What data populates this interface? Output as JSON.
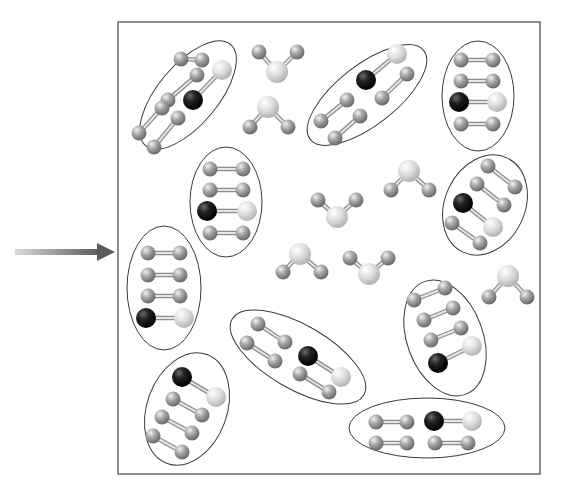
{
  "diagram": {
    "title": "",
    "colors": {
      "background": "#ffffff",
      "frame": "#6a6a6a",
      "ellipse": "#3a3a3a",
      "atom_gray": "#8a8a8a",
      "atom_light": "#d2d2d2",
      "atom_dark": "#111111",
      "bond": "#b8b8b8",
      "arrow_start": "#d8d8d8",
      "arrow_end": "#5a5a5a"
    },
    "frame": {
      "x": 118,
      "y": 22,
      "w": 422,
      "h": 452
    },
    "arrow": {
      "x1": 15,
      "y1": 252,
      "x2": 115,
      "y2": 252
    },
    "clusters": [
      {
        "name": "cluster-top-left",
        "cx": 188,
        "cy": 95,
        "rx": 30,
        "ry": 66,
        "rot": 40,
        "molecules": [
          {
            "a": [
              168,
              100,
              "g"
            ],
            "b": [
              197,
              75,
              "g"
            ]
          },
          {
            "a": [
              193,
              100,
              "d"
            ],
            "b": [
              222,
              70,
              "l"
            ]
          },
          {
            "a": [
              139,
              133,
              "g"
            ],
            "b": [
              162,
              108,
              "g"
            ]
          },
          {
            "a": [
              154,
              147,
              "g"
            ],
            "b": [
              178,
              118,
              "g"
            ]
          },
          {
            "a": [
              181,
              59,
              "g"
            ],
            "b": [
              202,
              60,
              "g"
            ]
          }
        ]
      },
      {
        "name": "cluster-top-center",
        "cx": 367,
        "cy": 95,
        "rx": 30,
        "ry": 72,
        "rot": 52,
        "molecules": [
          {
            "a": [
              366,
              80,
              "d"
            ],
            "b": [
              397,
              54,
              "l"
            ]
          },
          {
            "a": [
              382,
              98,
              "g"
            ],
            "b": [
              407,
              74,
              "g"
            ]
          },
          {
            "a": [
              321,
              121,
              "g"
            ],
            "b": [
              347,
              100,
              "g"
            ]
          },
          {
            "a": [
              335,
              138,
              "g"
            ],
            "b": [
              360,
              116,
              "g"
            ]
          }
        ]
      },
      {
        "name": "cluster-top-right",
        "cx": 478,
        "cy": 96,
        "rx": 36,
        "ry": 55,
        "rot": 0,
        "molecules": [
          {
            "a": [
              461,
              60,
              "g"
            ],
            "b": [
              493,
              60,
              "g"
            ]
          },
          {
            "a": [
              461,
              81,
              "g"
            ],
            "b": [
              493,
              81,
              "g"
            ]
          },
          {
            "a": [
              459,
              102,
              "d"
            ],
            "b": [
              497,
              102,
              "l"
            ]
          },
          {
            "a": [
              461,
              124,
              "g"
            ],
            "b": [
              493,
              124,
              "g"
            ]
          }
        ]
      },
      {
        "name": "cluster-mid-left",
        "cx": 226,
        "cy": 202,
        "rx": 36,
        "ry": 55,
        "rot": 0,
        "molecules": [
          {
            "a": [
              210,
              169,
              "g"
            ],
            "b": [
              243,
              169,
              "g"
            ]
          },
          {
            "a": [
              210,
              190,
              "g"
            ],
            "b": [
              243,
              190,
              "g"
            ]
          },
          {
            "a": [
              207,
              211,
              "d"
            ],
            "b": [
              247,
              211,
              "l"
            ]
          },
          {
            "a": [
              210,
              233,
              "g"
            ],
            "b": [
              243,
              233,
              "g"
            ]
          }
        ]
      },
      {
        "name": "cluster-right-mid",
        "cx": 485,
        "cy": 205,
        "rx": 40,
        "ry": 52,
        "rot": 25,
        "molecules": [
          {
            "a": [
              488,
              166,
              "g"
            ],
            "b": [
              515,
              187,
              "g"
            ]
          },
          {
            "a": [
              477,
              184,
              "g"
            ],
            "b": [
              504,
              205,
              "g"
            ]
          },
          {
            "a": [
              463,
              203,
              "d"
            ],
            "b": [
              493,
              227,
              "l"
            ]
          },
          {
            "a": [
              452,
              223,
              "g"
            ],
            "b": [
              480,
              243,
              "g"
            ]
          }
        ]
      },
      {
        "name": "cluster-left-vertical",
        "cx": 164,
        "cy": 288,
        "rx": 37,
        "ry": 62,
        "rot": 0,
        "molecules": [
          {
            "a": [
              148,
              253,
              "g"
            ],
            "b": [
              180,
              253,
              "g"
            ]
          },
          {
            "a": [
              148,
              275,
              "g"
            ],
            "b": [
              180,
              275,
              "g"
            ]
          },
          {
            "a": [
              148,
              296,
              "g"
            ],
            "b": [
              180,
              296,
              "g"
            ]
          },
          {
            "a": [
              146,
              318,
              "d"
            ],
            "b": [
              184,
              318,
              "l"
            ]
          }
        ]
      },
      {
        "name": "cluster-center-bottom",
        "cx": 298,
        "cy": 357,
        "rx": 32,
        "ry": 76,
        "rot": -60,
        "molecules": [
          {
            "a": [
              258,
              324,
              "g"
            ],
            "b": [
              285,
              342,
              "g"
            ]
          },
          {
            "a": [
              247,
              343,
              "g"
            ],
            "b": [
              275,
              361,
              "g"
            ]
          },
          {
            "a": [
              308,
              356,
              "d"
            ],
            "b": [
              341,
              377,
              "l"
            ]
          },
          {
            "a": [
              300,
              374,
              "g"
            ],
            "b": [
              329,
              392,
              "g"
            ]
          },
          {
            "a": [
              288,
              340,
              "g"
            ],
            "b": [
              288,
              340,
              "g"
            ]
          }
        ]
      },
      {
        "name": "cluster-right-bottom",
        "cx": 445,
        "cy": 338,
        "rx": 38,
        "ry": 60,
        "rot": -20,
        "molecules": [
          {
            "a": [
              414,
              300,
              "g"
            ],
            "b": [
              445,
              288,
              "g"
            ]
          },
          {
            "a": [
              424,
              320,
              "g"
            ],
            "b": [
              453,
              308,
              "g"
            ]
          },
          {
            "a": [
              431,
              340,
              "g"
            ],
            "b": [
              461,
              328,
              "g"
            ]
          },
          {
            "a": [
              438,
              363,
              "d"
            ],
            "b": [
              472,
              346,
              "l"
            ]
          }
        ]
      },
      {
        "name": "cluster-bottom-left",
        "cx": 187,
        "cy": 409,
        "rx": 40,
        "ry": 58,
        "rot": 20,
        "molecules": [
          {
            "a": [
              182,
              377,
              "d"
            ],
            "b": [
              216,
              397,
              "l"
            ]
          },
          {
            "a": [
              173,
              399,
              "g"
            ],
            "b": [
              202,
              415,
              "g"
            ]
          },
          {
            "a": [
              162,
              417,
              "g"
            ],
            "b": [
              192,
              433,
              "g"
            ]
          },
          {
            "a": [
              153,
              436,
              "g"
            ],
            "b": [
              182,
              452,
              "g"
            ]
          }
        ]
      },
      {
        "name": "cluster-bottom-right",
        "cx": 427,
        "cy": 428,
        "rx": 78,
        "ry": 30,
        "rot": 0,
        "molecules": [
          {
            "a": [
              376,
              422,
              "g"
            ],
            "b": [
              407,
              422,
              "g"
            ]
          },
          {
            "a": [
              376,
              443,
              "g"
            ],
            "b": [
              407,
              443,
              "g"
            ]
          },
          {
            "a": [
              434,
              421,
              "d"
            ],
            "b": [
              472,
              421,
              "l"
            ]
          },
          {
            "a": [
              435,
              443,
              "g"
            ],
            "b": [
              468,
              443,
              "g"
            ]
          }
        ]
      }
    ],
    "free_molecules": [
      {
        "name": "water-1",
        "center": [
          277,
          72
        ],
        "h1": [
          259,
          52
        ],
        "h2": [
          297,
          52
        ],
        "rot": 0
      },
      {
        "name": "water-2",
        "center": [
          268,
          107
        ],
        "h1": [
          250,
          127
        ],
        "h2": [
          288,
          127
        ],
        "rot": 0
      },
      {
        "name": "water-3",
        "center": [
          337,
          217
        ],
        "h1": [
          318,
          200
        ],
        "h2": [
          356,
          200
        ],
        "rot": 0
      },
      {
        "name": "water-4",
        "center": [
          409,
          171
        ],
        "h1": [
          391,
          190
        ],
        "h2": [
          429,
          190
        ],
        "rot": 0
      },
      {
        "name": "water-5",
        "center": [
          300,
          254
        ],
        "h1": [
          283,
          272
        ],
        "h2": [
          321,
          272
        ],
        "rot": 0
      },
      {
        "name": "water-6",
        "center": [
          369,
          274
        ],
        "h1": [
          350,
          258
        ],
        "h2": [
          388,
          258
        ],
        "rot": 0
      },
      {
        "name": "water-7",
        "center": [
          508,
          276
        ],
        "h1": [
          489,
          297
        ],
        "h2": [
          527,
          297
        ],
        "rot": 0
      }
    ]
  }
}
